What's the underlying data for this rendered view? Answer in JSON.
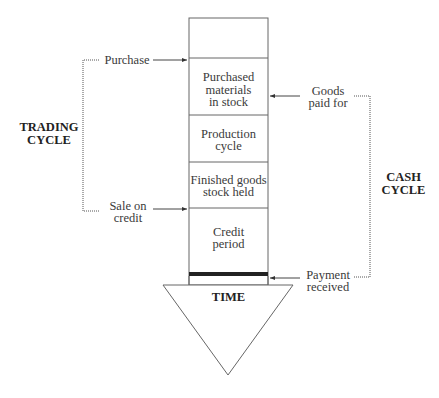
{
  "diagram": {
    "stages": [
      {
        "id": "empty",
        "label": ""
      },
      {
        "id": "purchased-materials",
        "label_lines": [
          "Purchased",
          "materials",
          "in stock"
        ]
      },
      {
        "id": "production-cycle",
        "label_lines": [
          "Production",
          "cycle"
        ]
      },
      {
        "id": "finished-goods",
        "label_lines": [
          "Finished goods",
          "stock held"
        ]
      },
      {
        "id": "credit-period",
        "label_lines": [
          "Credit",
          "period"
        ]
      }
    ],
    "time_label": "TIME",
    "events": {
      "purchase": "Purchase",
      "sale_on_credit": [
        "Sale on",
        "credit"
      ],
      "goods_paid_for": [
        "Goods",
        "paid for"
      ],
      "payment_received": [
        "Payment",
        "received"
      ]
    },
    "cycles": {
      "trading": [
        "TRADING",
        "CYCLE"
      ],
      "cash": [
        "CASH",
        "CYCLE"
      ]
    }
  }
}
